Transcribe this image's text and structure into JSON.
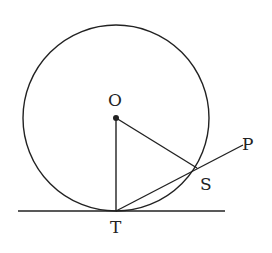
{
  "diagram": {
    "colors": {
      "stroke": "#222222",
      "background": "#ffffff"
    },
    "circle": {
      "center_label": "O",
      "cx": 116,
      "cy": 118,
      "r": 93
    },
    "points": {
      "O": {
        "label": "O",
        "x": 116,
        "y": 118
      },
      "T": {
        "label": "T",
        "x": 116,
        "y": 211
      },
      "S": {
        "label": "S",
        "x": 197,
        "y": 168
      },
      "P": {
        "label": "P",
        "x": 243,
        "y": 145
      }
    },
    "segments": [
      {
        "from": "O",
        "to": "T"
      },
      {
        "from": "O",
        "to": "S"
      },
      {
        "from": "T",
        "to": "P"
      }
    ],
    "tangent_line": {
      "x1": 18,
      "x2": 225,
      "y": 211,
      "touches": "T"
    }
  }
}
